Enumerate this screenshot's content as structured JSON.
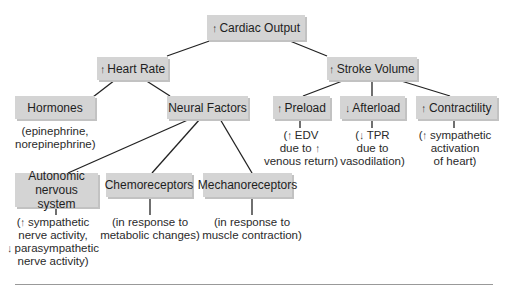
{
  "diagram": {
    "nodes": {
      "cardiac_output": {
        "arrow": "↑",
        "label": "Cardiac Output"
      },
      "heart_rate": {
        "arrow": "↑",
        "label": "Heart Rate"
      },
      "stroke_volume": {
        "arrow": "↑",
        "label": "Stroke Volume"
      },
      "hormones": {
        "label": "Hormones"
      },
      "neural_factors": {
        "label": "Neural Factors"
      },
      "preload": {
        "arrow": "↑",
        "label": "Preload"
      },
      "afterload": {
        "arrow": "↓",
        "label": "Afterload"
      },
      "contractility": {
        "arrow": "↑",
        "label": "Contractility"
      },
      "autonomic": {
        "line1": "Autonomic",
        "line2": "nervous system"
      },
      "chemoreceptors": {
        "label": "Chemoreceptors"
      },
      "mechanoreceptors": {
        "label": "Mechanoreceptors"
      }
    },
    "notes": {
      "hormones": {
        "line1": "(epinephrine,",
        "line2": "norepinephrine)"
      },
      "preload": {
        "l1_pre": "(",
        "l1_arrow": "↑",
        "l1_text": "EDV",
        "l2_text": "due to",
        "l2_arrow": "↑",
        "l3": "venous return)"
      },
      "afterload": {
        "l1_pre": "(",
        "l1_arrow": "↓",
        "l1_text": "TPR",
        "l2": "due to",
        "l3": "vasodilation)"
      },
      "contractility": {
        "l1_pre": "(",
        "l1_arrow": "↑",
        "l1_text": "sympathetic",
        "l2": "activation",
        "l3": "of heart)"
      },
      "autonomic": {
        "l1_pre": "(",
        "l1_arrow": "↑",
        "l1_text": "sympathetic",
        "l2": "nerve activity,",
        "l3_arrow": "↓",
        "l3_text": "parasympathetic",
        "l4": "nerve activity)"
      },
      "chemoreceptors": {
        "line1": "(in response to",
        "line2": "metabolic changes)"
      },
      "mechanoreceptors": {
        "line1": "(in response to",
        "line2": "muscle contraction)"
      }
    }
  }
}
